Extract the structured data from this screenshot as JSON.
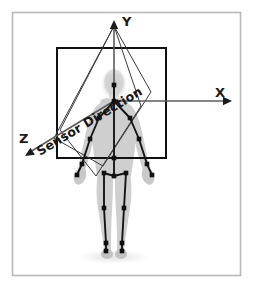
{
  "figure": {
    "background_color": "#ffffff",
    "frame_color": "#b9b9b9",
    "frame": {
      "x": 12,
      "y": 12,
      "width": 228,
      "height": 263
    }
  },
  "axes": {
    "origin": {
      "x": 114,
      "y": 101
    },
    "color": "#5b5b5b",
    "items": [
      {
        "id": "y-axis",
        "label": "Y",
        "label_x": 122,
        "label_y": 26,
        "line": {
          "x1": 114,
          "y1": 101,
          "x2": 114,
          "y2": 24
        },
        "arrow_at": {
          "x": 114,
          "y": 20
        },
        "direction": "up"
      },
      {
        "id": "x-axis",
        "label": "X",
        "label_x": 215,
        "label_y": 97,
        "line": {
          "x1": 114,
          "y1": 101,
          "x2": 228,
          "y2": 101
        },
        "arrow_at": {
          "x": 232,
          "y": 101
        },
        "direction": "right"
      },
      {
        "id": "z-axis",
        "label": "Z",
        "label_x": 19,
        "label_y": 143,
        "line": {
          "x1": 114,
          "y1": 101,
          "x2": 30,
          "y2": 152
        },
        "arrow_at": {
          "x": 25,
          "y": 156
        },
        "direction": "lower-left"
      }
    ]
  },
  "sensor": {
    "label": "Sensor Direction",
    "label_anchor": {
      "x": 40,
      "y": 156
    },
    "label_rotation_deg": -31,
    "color": "#111111"
  },
  "frame_box": {
    "name": "sensor-field-of-view-box",
    "x": 57,
    "y": 48,
    "width": 109,
    "height": 110,
    "stroke": "#111111",
    "stroke_width": 2,
    "fill": "none"
  },
  "quads": {
    "stroke": "#3a3a3a",
    "stroke_width": 1,
    "fill": "none",
    "shapes": [
      {
        "name": "sensor-view-quad-outer",
        "points": "114,26 151,92 103,166 54,138"
      },
      {
        "name": "sensor-view-quad-inner",
        "points": "114,26 141,106 96,176 60,130"
      }
    ]
  },
  "body": {
    "silhouette_color": "#c9c9c9",
    "silhouette_color_light": "#d9d9d9",
    "skeleton_color": "#151515",
    "joint_color": "#111111",
    "joints": [
      {
        "name": "head",
        "x": 114,
        "y": 85
      },
      {
        "name": "neck",
        "x": 114,
        "y": 101
      },
      {
        "name": "shoulder-left",
        "x": 99,
        "y": 118
      },
      {
        "name": "shoulder-right",
        "x": 130,
        "y": 118
      },
      {
        "name": "elbow-left",
        "x": 90,
        "y": 139
      },
      {
        "name": "elbow-right",
        "x": 139,
        "y": 139
      },
      {
        "name": "wrist-left",
        "x": 82,
        "y": 164
      },
      {
        "name": "wrist-right",
        "x": 147,
        "y": 164
      },
      {
        "name": "hand-left",
        "x": 77,
        "y": 175
      },
      {
        "name": "hand-right",
        "x": 152,
        "y": 175
      },
      {
        "name": "spine-mid",
        "x": 114,
        "y": 158
      },
      {
        "name": "hip-center",
        "x": 114,
        "y": 176
      },
      {
        "name": "hip-left",
        "x": 104,
        "y": 173
      },
      {
        "name": "hip-right",
        "x": 126,
        "y": 173
      },
      {
        "name": "knee-left",
        "x": 104,
        "y": 208
      },
      {
        "name": "knee-right",
        "x": 124,
        "y": 208
      },
      {
        "name": "ankle-left",
        "x": 106,
        "y": 243
      },
      {
        "name": "ankle-right",
        "x": 122,
        "y": 243
      },
      {
        "name": "foot-left",
        "x": 106,
        "y": 251
      },
      {
        "name": "foot-right",
        "x": 122,
        "y": 251
      }
    ],
    "bones": [
      [
        "head",
        "neck"
      ],
      [
        "neck",
        "shoulder-left"
      ],
      [
        "neck",
        "shoulder-right"
      ],
      [
        "shoulder-left",
        "elbow-left"
      ],
      [
        "elbow-left",
        "wrist-left"
      ],
      [
        "wrist-left",
        "hand-left"
      ],
      [
        "shoulder-right",
        "elbow-right"
      ],
      [
        "elbow-right",
        "wrist-right"
      ],
      [
        "wrist-right",
        "hand-right"
      ],
      [
        "neck",
        "spine-mid"
      ],
      [
        "spine-mid",
        "hip-center"
      ],
      [
        "hip-center",
        "hip-left"
      ],
      [
        "hip-center",
        "hip-right"
      ],
      [
        "hip-left",
        "knee-left"
      ],
      [
        "hip-right",
        "knee-right"
      ],
      [
        "knee-left",
        "ankle-left"
      ],
      [
        "knee-right",
        "ankle-right"
      ],
      [
        "ankle-left",
        "foot-left"
      ],
      [
        "ankle-right",
        "foot-right"
      ]
    ]
  }
}
